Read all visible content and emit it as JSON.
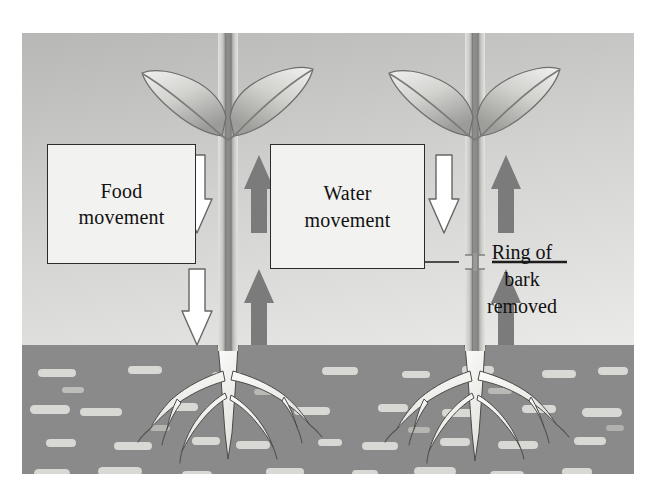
{
  "figure": {
    "type": "biology-diagram",
    "frame": {
      "x": 22,
      "y": 33,
      "width": 612,
      "height": 441
    }
  },
  "labels": {
    "food_box": "Food\nmovement",
    "water_box": "Water\nmovement",
    "bark_note": "Ring of\nbark\nremoved"
  },
  "colors": {
    "sky_top": "#b9b9b9",
    "sky_bottom": "#ececea",
    "soil": "#8a8a8a",
    "soil_fleck": "#d6d6d2",
    "water_arrow": "#7b7b7b",
    "food_arrow_fill": "#ffffff",
    "food_arrow_stroke": "#555555",
    "stem_light": "#dadad6",
    "stem_dark": "#8d8d8d",
    "leaf_light": "#e8e8e6",
    "leaf_dark": "#9d9d9d",
    "root": "#f4f4f1",
    "outline": "#2b2b2b",
    "text": "#111111"
  },
  "plants": [
    {
      "id": "plant-left",
      "name": "intact-plant",
      "stem_x": 206,
      "bark_removed": false,
      "food_arrows": [
        {
          "direction": "down",
          "style": "outline",
          "y_top": 122,
          "y_bottom": 200
        },
        {
          "direction": "down",
          "style": "outline",
          "y_top": 232,
          "y_bottom": 312
        }
      ],
      "water_arrows": [
        {
          "direction": "up",
          "style": "solid",
          "y_top": 122,
          "y_bottom": 200
        },
        {
          "direction": "up",
          "style": "solid",
          "y_top": 232,
          "y_bottom": 312
        }
      ],
      "leaves": [
        "left-leaf",
        "right-leaf"
      ],
      "roots": "root-system"
    },
    {
      "id": "plant-right",
      "name": "girdled-plant",
      "stem_x": 453,
      "bark_removed": true,
      "food_arrows": [
        {
          "direction": "down",
          "style": "outline",
          "y_top": 122,
          "y_bottom": 200
        }
      ],
      "water_arrows": [
        {
          "direction": "up",
          "style": "solid",
          "y_top": 122,
          "y_bottom": 200
        },
        {
          "direction": "up",
          "style": "solid",
          "y_top": 232,
          "y_bottom": 312
        }
      ],
      "leaves": [
        "left-leaf",
        "right-leaf"
      ],
      "roots": "root-system",
      "girdle": {
        "y": 222,
        "height": 14
      }
    }
  ],
  "soil": {
    "name": "soil-layer",
    "top_y": 312,
    "fleck_rows": 6,
    "fleck_count": 42
  },
  "annotation_lines": [
    {
      "name": "bark-pointer-left",
      "x1": 398,
      "x2": 437,
      "y": 229
    },
    {
      "name": "bark-pointer-right",
      "x1": 470,
      "x2": 545,
      "y": 229
    }
  ]
}
